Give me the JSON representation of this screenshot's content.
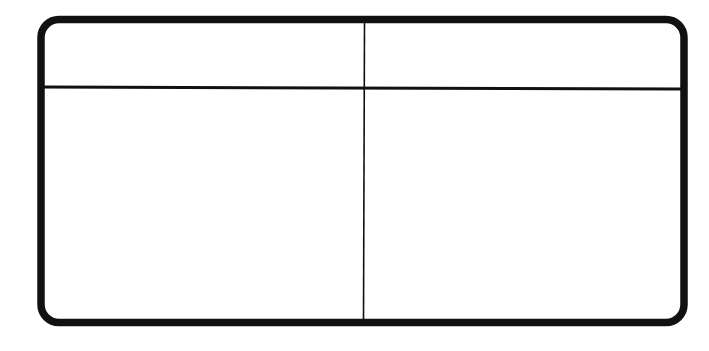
{
  "diagram": {
    "type": "two-column table outline",
    "rows": 2,
    "columns": 2,
    "colors": {
      "stroke": "#111111",
      "background": "#ffffff"
    },
    "cells": [
      {
        "row": 0,
        "col": 0,
        "text": ""
      },
      {
        "row": 0,
        "col": 1,
        "text": ""
      },
      {
        "row": 1,
        "col": 0,
        "text": ""
      },
      {
        "row": 1,
        "col": 1,
        "text": ""
      }
    ]
  }
}
